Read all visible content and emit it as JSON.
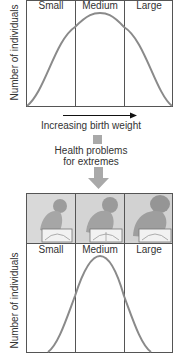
{
  "top_panel": {
    "ylabel": "Number of individuals",
    "categories": [
      "Small",
      "Medium",
      "Large"
    ],
    "curve": "wide-bell"
  },
  "arrow_caption": "Increasing birth weight",
  "selection_note": {
    "line1": "Health problems",
    "line2": "for extremes"
  },
  "bottom_panel": {
    "ylabel": "Number of individuals",
    "categories": [
      "Small",
      "Medium",
      "Large"
    ],
    "images": [
      "small-baby-on-scale",
      "medium-baby-on-scale",
      "large-baby-on-scale"
    ],
    "curve": "narrow-bell"
  },
  "colors": {
    "curve": "#8a8a8a",
    "frame": "#555555",
    "arrow_gray": "#a9a9a9",
    "photo_bg": "#d6d6d6"
  }
}
